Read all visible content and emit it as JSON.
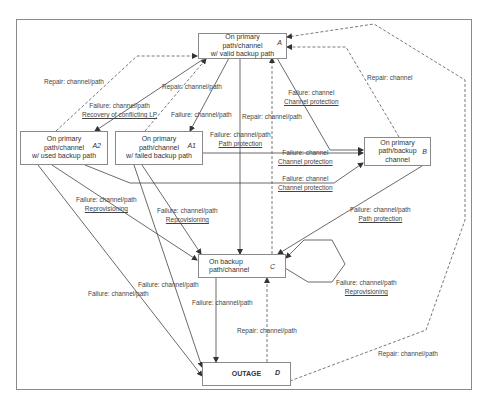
{
  "states": {
    "A": {
      "tag": "A",
      "text": "On primary\npath/channel\nw/ valid backup path"
    },
    "A2": {
      "tag": "A2",
      "text": "On primary\npath/channel\nw/ used backup path"
    },
    "A1": {
      "tag": "A1",
      "text": "On primary\npath/channel\nw/ failed backup path"
    },
    "B": {
      "tag": "B",
      "text": "On primary\npath/backup\nchannel"
    },
    "C": {
      "tag": "C",
      "text": "On backup\npath/channel"
    },
    "D": {
      "tag": "D",
      "text": "OUTAGE"
    }
  },
  "labels": {
    "l1": {
      "event": "Repair: channel/path",
      "action": ""
    },
    "l2": {
      "event": "Repair: channel/path",
      "action": ""
    },
    "l3": {
      "event": "Failure: channel/path",
      "action": "Recovery of conflicting LP"
    },
    "l4": {
      "event": "Failure: channel/path",
      "action": ""
    },
    "l5": {
      "event": "Failure: channel",
      "action": "Channel protection"
    },
    "l6": {
      "event": "Repair: channel",
      "action": ""
    },
    "l7": {
      "event": "Repair: channel/path",
      "action": ""
    },
    "l8": {
      "event": "Failure: channel/path",
      "action": "Path protection"
    },
    "l9": {
      "event": "Failure: channel",
      "action": "Channel protection"
    },
    "l10": {
      "event": "Failure: channel",
      "action": "Channel protection"
    },
    "l11": {
      "event": "Failure: channel/path",
      "action": "Reprovisioning"
    },
    "l12": {
      "event": "Failure: channel/path",
      "action": "Reprovisioning"
    },
    "l13": {
      "event": "Failure: channel/path",
      "action": "Path protection"
    },
    "l14": {
      "event": "Failure: channel/path",
      "action": "Reprovisioning"
    },
    "l15": {
      "event": "Failure: channel/path",
      "action": ""
    },
    "l16": {
      "event": "Failure: channel/path",
      "action": ""
    },
    "l17": {
      "event": "Failure: channel/path",
      "action": ""
    },
    "l18": {
      "event": "Repair: channel/path",
      "action": ""
    },
    "l19": {
      "event": "Repair: channel/path",
      "action": ""
    }
  },
  "colors": {
    "line": "#444444",
    "border": "#8a8a8a",
    "text": "#333333"
  }
}
